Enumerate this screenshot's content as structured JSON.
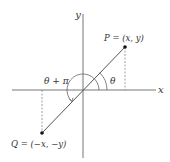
{
  "diagram": {
    "axes": {
      "x_label": "x",
      "y_label": "y"
    },
    "points": {
      "P": {
        "label": "P = (x, y)"
      },
      "Q": {
        "label": "Q = (−x, −y)"
      }
    },
    "angles": {
      "theta": "θ",
      "theta_plus_pi": "θ + π"
    },
    "colors": {
      "line": "#555555",
      "axis": "#777777",
      "dash": "#888888",
      "point": "#111111"
    }
  }
}
